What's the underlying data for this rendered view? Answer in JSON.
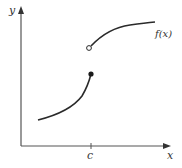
{
  "diagram": {
    "axes": {
      "x_label": "x",
      "y_label": "y",
      "tick_label": "c"
    },
    "function_label": "f(x)",
    "colors": {
      "axis": "#555555",
      "curve": "#2a2a2a",
      "text": "#333333"
    },
    "points": {
      "filled": {
        "description": "closed point on lower branch at x=c"
      },
      "open": {
        "description": "open point on upper branch at x=c"
      }
    }
  }
}
